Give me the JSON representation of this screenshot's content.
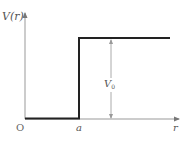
{
  "diagram": {
    "y_axis_label": "V(r)",
    "x_axis_label": "r",
    "origin_label": "O",
    "step_position_label": "a",
    "step_height_label": "V",
    "step_height_subscript": "0",
    "colors": {
      "potential_line": "#222222",
      "axes": "#888888",
      "dimension_arrow": "#999999",
      "text": "#555555"
    }
  }
}
